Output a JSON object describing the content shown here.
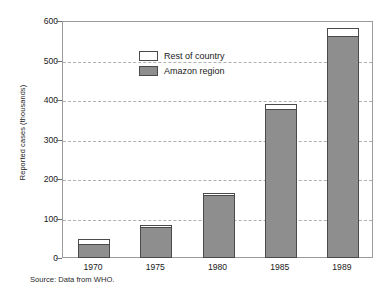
{
  "chart_data": {
    "type": "bar",
    "subtype": "stacked-bar",
    "title": "",
    "xlabel": "",
    "ylabel": "Reported cases (thousands)",
    "categories": [
      "1970",
      "1975",
      "1980",
      "1985",
      "1989"
    ],
    "series": [
      {
        "name": "Amazon region",
        "color": "#8e8e8e",
        "values": [
          35,
          78,
          160,
          378,
          562
        ]
      },
      {
        "name": "Rest of country",
        "color": "#ffffff",
        "values": [
          15,
          7,
          8,
          15,
          23
        ]
      }
    ],
    "totals": [
      50,
      85,
      168,
      393,
      585
    ],
    "ylim": [
      0,
      600
    ],
    "yticks": [
      0,
      100,
      200,
      300,
      400,
      500,
      600
    ],
    "ytick_labels": [
      "0",
      "100",
      "200",
      "300",
      "400",
      "500",
      "600"
    ],
    "grid": "horizontal-dashed",
    "legend_position": "top-left-inside",
    "source_note": "Source: Data from WHO."
  },
  "legend": {
    "items": [
      {
        "label": "Rest of country",
        "color": "#ffffff"
      },
      {
        "label": "Amazon region",
        "color": "#8e8e8e"
      }
    ]
  },
  "axes": {
    "y_title": "Reported cases (thousands)"
  },
  "footer": {
    "source": "Source: Data from WHO."
  }
}
